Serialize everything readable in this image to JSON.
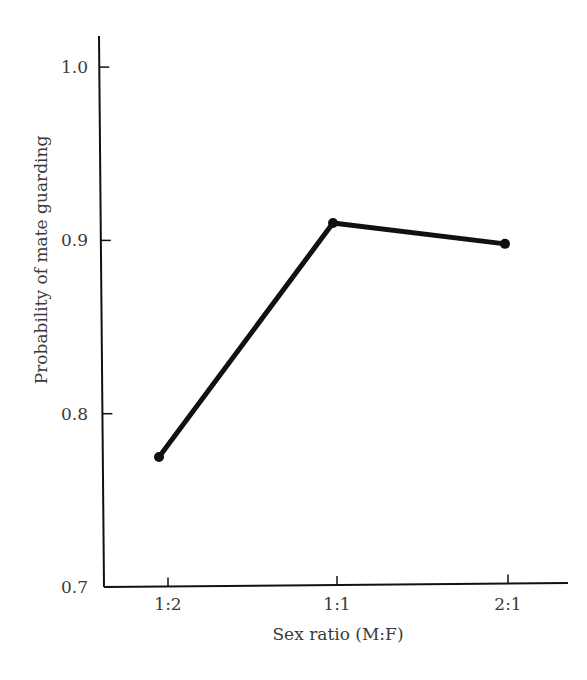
{
  "chart_data": {
    "type": "line",
    "title": "",
    "xlabel": "Sex ratio (M:F)",
    "ylabel": "Probability of mate guarding",
    "categories": [
      "1:2",
      "1:1",
      "2:1"
    ],
    "values": [
      0.775,
      0.91,
      0.898
    ],
    "y_ticks": [
      "0.7",
      "0.8",
      "0.9",
      "1.0"
    ],
    "ylim": [
      0.7,
      1.02
    ],
    "grid": false,
    "legend": null,
    "line_color": "#111111",
    "marker": "circle"
  }
}
